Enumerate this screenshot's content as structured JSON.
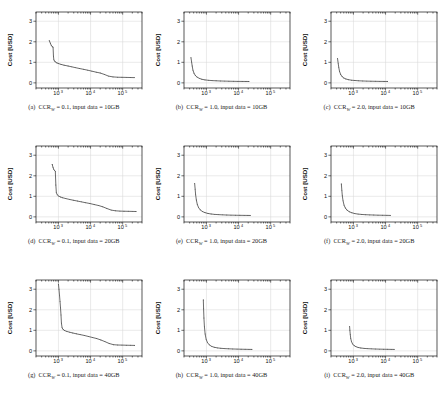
{
  "figure": {
    "layout": "3x3 grid of line plots",
    "background": "#ffffff",
    "curve_color": "#3a3a3a",
    "grid_color": "#d9d9d9",
    "frame_color": "#111111"
  },
  "axes": {
    "xlabel": "Execution Time [s]",
    "ylabel": "Cost [USD]",
    "x_tick_labels": [
      "10",
      "10",
      "10"
    ],
    "x_tick_exponents": [
      "3",
      "4",
      "5"
    ],
    "x_tick_values": [
      1000,
      10000,
      100000
    ],
    "y_tick_labels": [
      "0",
      "1",
      "2",
      "3"
    ],
    "y_tick_values": [
      0,
      1,
      2,
      3
    ],
    "xscale": "log",
    "yscale": "linear",
    "xlim": [
      200,
      400000
    ],
    "ylim": [
      -0.25,
      3.45
    ],
    "grid": true
  },
  "captions": [
    {
      "tag": "(a)",
      "metric": "CCR",
      "subscript": "W",
      "value": "= 0.1,",
      "data": "input data = 10GB"
    },
    {
      "tag": "(b)",
      "metric": "CCR",
      "subscript": "W",
      "value": "= 1.0,",
      "data": "input data = 10GB"
    },
    {
      "tag": "(c)",
      "metric": "CCR",
      "subscript": "W",
      "value": "= 2.0,",
      "data": "input data = 10GB"
    },
    {
      "tag": "(d)",
      "metric": "CCR",
      "subscript": "W",
      "value": "= 0.1,",
      "data": "input data = 20GB"
    },
    {
      "tag": "(e)",
      "metric": "CCR",
      "subscript": "W",
      "value": "= 1.0,",
      "data": "input data = 20GB"
    },
    {
      "tag": "(f)",
      "metric": "CCR",
      "subscript": "W",
      "value": "= 2.0,",
      "data": "input data = 20GB"
    },
    {
      "tag": "(g)",
      "metric": "CCR",
      "subscript": "W",
      "value": "= 0.1,",
      "data": "input data = 40GB"
    },
    {
      "tag": "(h)",
      "metric": "CCR",
      "subscript": "W",
      "value": "= 1.0,",
      "data": "input data = 40GB"
    },
    {
      "tag": "(i)",
      "metric": "CCR",
      "subscript": "W",
      "value": "= 2.0,",
      "data": "input data = 40GB"
    }
  ],
  "chart_data": [
    {
      "type": "line",
      "panel": "a",
      "title": "(a) CCR_W = 0.1, input data = 10GB",
      "xlabel": "Execution Time [s]",
      "ylabel": "Cost [USD]",
      "xscale": "log",
      "xlim": [
        200,
        400000
      ],
      "ylim": [
        -0.25,
        3.45
      ],
      "grid": true,
      "x": [
        520,
        560,
        600,
        640,
        680,
        700,
        720,
        760,
        800,
        900,
        1000,
        1200,
        1500,
        2000,
        2600,
        3400,
        4500,
        6000,
        8000,
        11000,
        15000,
        20000,
        27000,
        36000,
        50000,
        70000,
        95000,
        130000,
        175000,
        230000
      ],
      "y": [
        2.05,
        1.93,
        1.82,
        1.76,
        1.74,
        1.3,
        1.12,
        1.06,
        1.02,
        0.97,
        0.94,
        0.9,
        0.86,
        0.82,
        0.78,
        0.74,
        0.7,
        0.66,
        0.62,
        0.57,
        0.52,
        0.48,
        0.41,
        0.33,
        0.29,
        0.275,
        0.27,
        0.265,
        0.26,
        0.255
      ]
    },
    {
      "type": "line",
      "panel": "b",
      "title": "(b) CCR_W = 1.0, input data = 10GB",
      "xlabel": "Execution Time [s]",
      "ylabel": "Cost [USD]",
      "xscale": "log",
      "xlim": [
        200,
        400000
      ],
      "ylim": [
        -0.25,
        3.45
      ],
      "grid": true,
      "x": [
        330,
        345,
        360,
        380,
        410,
        450,
        510,
        600,
        720,
        900,
        1150,
        1500,
        2000,
        2700,
        3700,
        5000,
        7000,
        9500,
        13000,
        17000,
        21000
      ],
      "y": [
        1.22,
        1.02,
        0.82,
        0.62,
        0.47,
        0.36,
        0.28,
        0.22,
        0.175,
        0.145,
        0.125,
        0.11,
        0.1,
        0.092,
        0.086,
        0.08,
        0.075,
        0.072,
        0.07,
        0.068,
        0.066
      ]
    },
    {
      "type": "line",
      "panel": "c",
      "title": "(c) CCR_W = 2.0, input data = 10GB",
      "xlabel": "Execution Time [s]",
      "ylabel": "Cost [USD]",
      "xscale": "log",
      "xlim": [
        200,
        400000
      ],
      "ylim": [
        -0.25,
        3.45
      ],
      "grid": true,
      "x": [
        320,
        335,
        350,
        370,
        400,
        440,
        500,
        580,
        700,
        870,
        1100,
        1450,
        1950,
        2600,
        3500,
        4800,
        6600,
        9000,
        11500
      ],
      "y": [
        1.18,
        0.95,
        0.74,
        0.55,
        0.41,
        0.31,
        0.24,
        0.19,
        0.155,
        0.13,
        0.115,
        0.1,
        0.092,
        0.085,
        0.08,
        0.076,
        0.072,
        0.07,
        0.068
      ]
    },
    {
      "type": "line",
      "panel": "d",
      "title": "(d) CCR_W = 0.1, input data = 20GB",
      "xlabel": "Execution Time [s]",
      "ylabel": "Cost [USD]",
      "xscale": "log",
      "xlim": [
        200,
        400000
      ],
      "ylim": [
        -0.25,
        3.45
      ],
      "grid": true,
      "x": [
        640,
        680,
        720,
        760,
        800,
        830,
        860,
        920,
        1000,
        1150,
        1350,
        1700,
        2200,
        2900,
        3900,
        5200,
        7000,
        9500,
        13000,
        18000,
        24000,
        32000,
        44000,
        60000,
        82000,
        110000,
        150000,
        200000,
        260000
      ],
      "y": [
        2.55,
        2.4,
        2.3,
        2.25,
        2.22,
        1.55,
        1.18,
        1.07,
        1.02,
        0.97,
        0.93,
        0.89,
        0.85,
        0.81,
        0.77,
        0.73,
        0.69,
        0.65,
        0.6,
        0.55,
        0.49,
        0.41,
        0.33,
        0.295,
        0.28,
        0.275,
        0.27,
        0.265,
        0.26
      ]
    },
    {
      "type": "line",
      "panel": "e",
      "title": "(e) CCR_W = 1.0, input data = 20GB",
      "xlabel": "Execution Time [s]",
      "ylabel": "Cost [USD]",
      "xscale": "log",
      "xlim": [
        200,
        400000
      ],
      "ylim": [
        -0.25,
        3.45
      ],
      "grid": true,
      "x": [
        430,
        445,
        460,
        485,
        520,
        570,
        640,
        750,
        900,
        1120,
        1400,
        1800,
        2400,
        3200,
        4300,
        5800,
        8000,
        11000,
        15000,
        19500,
        23000
      ],
      "y": [
        1.62,
        1.35,
        1.08,
        0.82,
        0.6,
        0.45,
        0.34,
        0.26,
        0.205,
        0.165,
        0.14,
        0.12,
        0.108,
        0.098,
        0.09,
        0.084,
        0.079,
        0.075,
        0.072,
        0.07,
        0.068
      ]
    },
    {
      "type": "line",
      "panel": "f",
      "title": "(f) CCR_W = 2.0, input data = 20GB",
      "xlabel": "Execution Time [s]",
      "ylabel": "Cost [USD]",
      "xscale": "log",
      "xlim": [
        200,
        400000
      ],
      "ylim": [
        -0.25,
        3.45
      ],
      "grid": true,
      "x": [
        420,
        435,
        450,
        475,
        510,
        560,
        630,
        740,
        890,
        1100,
        1400,
        1800,
        2400,
        3200,
        4300,
        5800,
        8000,
        11000,
        14000
      ],
      "y": [
        1.6,
        1.3,
        1.03,
        0.78,
        0.57,
        0.43,
        0.33,
        0.25,
        0.2,
        0.16,
        0.135,
        0.118,
        0.105,
        0.096,
        0.089,
        0.083,
        0.078,
        0.074,
        0.07
      ]
    },
    {
      "type": "line",
      "panel": "g",
      "title": "(g) CCR_W = 0.1, input data = 40GB",
      "xlabel": "Execution Time [s]",
      "ylabel": "Cost [USD]",
      "xscale": "log",
      "xlim": [
        200,
        400000
      ],
      "ylim": [
        -0.25,
        3.45
      ],
      "grid": true,
      "x": [
        1000,
        1040,
        1080,
        1120,
        1160,
        1200,
        1240,
        1300,
        1400,
        1550,
        1800,
        2200,
        2800,
        3600,
        4800,
        6400,
        8600,
        11500,
        15500,
        21000,
        28000,
        38000,
        52000,
        70000,
        95000,
        130000,
        175000,
        235000
      ],
      "y": [
        3.25,
        3.0,
        2.7,
        2.4,
        2.1,
        1.75,
        1.35,
        1.12,
        1.04,
        0.99,
        0.95,
        0.91,
        0.87,
        0.83,
        0.79,
        0.75,
        0.7,
        0.65,
        0.6,
        0.53,
        0.45,
        0.36,
        0.3,
        0.285,
        0.28,
        0.275,
        0.27,
        0.265
      ]
    },
    {
      "type": "line",
      "panel": "h",
      "title": "(h) CCR_W = 1.0, input data = 40GB",
      "xlabel": "Execution Time [s]",
      "ylabel": "Cost [USD]",
      "xscale": "log",
      "xlim": [
        200,
        400000
      ],
      "ylim": [
        -0.25,
        3.45
      ],
      "grid": true,
      "x": [
        800,
        815,
        835,
        865,
        910,
        980,
        1080,
        1230,
        1450,
        1750,
        2200,
        2800,
        3700,
        4900,
        6600,
        9000,
        12000,
        16000,
        21000,
        26000
      ],
      "y": [
        2.48,
        2.05,
        1.6,
        1.18,
        0.82,
        0.56,
        0.4,
        0.29,
        0.22,
        0.175,
        0.145,
        0.125,
        0.11,
        0.1,
        0.092,
        0.086,
        0.08,
        0.076,
        0.072,
        0.07
      ]
    },
    {
      "type": "line",
      "panel": "i",
      "title": "(i) CCR_W = 2.0, input data = 40GB",
      "xlabel": "Execution Time [s]",
      "ylabel": "Cost [USD]",
      "xscale": "log",
      "xlim": [
        200,
        400000
      ],
      "ylim": [
        -0.25,
        3.45
      ],
      "grid": true,
      "x": [
        760,
        775,
        795,
        825,
        870,
        940,
        1040,
        1190,
        1400,
        1700,
        2150,
        2750,
        3600,
        4800,
        6400,
        8700,
        11500,
        15000,
        18500
      ],
      "y": [
        1.18,
        1.0,
        0.8,
        0.6,
        0.45,
        0.34,
        0.26,
        0.205,
        0.165,
        0.14,
        0.12,
        0.107,
        0.098,
        0.09,
        0.084,
        0.079,
        0.075,
        0.072,
        0.07
      ]
    }
  ]
}
